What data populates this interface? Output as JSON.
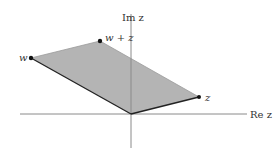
{
  "diagram": {
    "axes": {
      "real_label": "Re z",
      "imag_label": "Im z",
      "color": "#8a8a8a"
    },
    "points": {
      "origin": {
        "x": 131,
        "y": 114
      },
      "w": {
        "label": "w",
        "x": 31,
        "y": 58
      },
      "w_plus_z": {
        "label": "w + z",
        "x": 100,
        "y": 41
      },
      "z": {
        "label": "z",
        "x": 199,
        "y": 97
      }
    },
    "colors": {
      "fill": "#b4b4b4",
      "edge": "#222222",
      "point": "#111111"
    }
  }
}
